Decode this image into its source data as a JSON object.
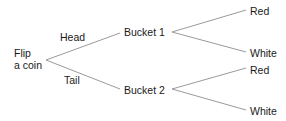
{
  "diagram": {
    "type": "tree",
    "line_color": "#9a9a9a",
    "text_color": "#1a1a1a",
    "root": {
      "id": "root",
      "label_line1": "Flip",
      "label_line2": "a coin"
    },
    "nodes": [
      {
        "id": "b1",
        "label": "Bucket 1"
      },
      {
        "id": "b2",
        "label": "Bucket 2"
      },
      {
        "id": "b1r",
        "label": "Red"
      },
      {
        "id": "b1w",
        "label": "White"
      },
      {
        "id": "b2r",
        "label": "Red"
      },
      {
        "id": "b2w",
        "label": "White"
      }
    ],
    "edges": [
      {
        "from": "root",
        "to": "b1",
        "label": "Head"
      },
      {
        "from": "root",
        "to": "b2",
        "label": "Tail"
      },
      {
        "from": "b1",
        "to": "b1r",
        "label": ""
      },
      {
        "from": "b1",
        "to": "b1w",
        "label": ""
      },
      {
        "from": "b2",
        "to": "b2r",
        "label": ""
      },
      {
        "from": "b2",
        "to": "b2w",
        "label": ""
      }
    ]
  }
}
